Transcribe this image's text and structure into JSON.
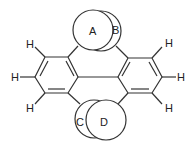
{
  "diagram": {
    "sphere_labels": {
      "A": "A",
      "B": "B",
      "C": "C",
      "D": "D"
    },
    "hydrogen_label": "H",
    "hydrogens": [
      "H",
      "H",
      "H",
      "H",
      "H",
      "H"
    ]
  }
}
